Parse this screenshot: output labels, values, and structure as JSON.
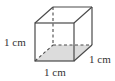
{
  "figure": {
    "type": "cube",
    "labels": {
      "height": "1 cm",
      "width": "1 cm",
      "depth": "1 cm"
    },
    "colors": {
      "edges": "#4a4a4a",
      "bottom_face": "#dcdcdc",
      "text": "#333333"
    }
  }
}
